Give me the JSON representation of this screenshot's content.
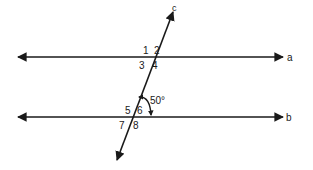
{
  "diagram": {
    "colors": {
      "line": "#1a1a1a",
      "background": "#ffffff"
    },
    "lines": {
      "a": {
        "label": "a",
        "y": 57,
        "x1": 18,
        "x2": 283
      },
      "b": {
        "label": "b",
        "y": 117,
        "x1": 18,
        "x2": 283
      },
      "c": {
        "label": "c",
        "x1": 117,
        "y1": 160,
        "x2": 173,
        "y2": 12
      }
    },
    "angle_labels": {
      "1": "1",
      "2": "2",
      "3": "3",
      "4": "4",
      "5": "5",
      "6": "6",
      "7": "7",
      "8": "8"
    },
    "angle_measure": "50°"
  }
}
